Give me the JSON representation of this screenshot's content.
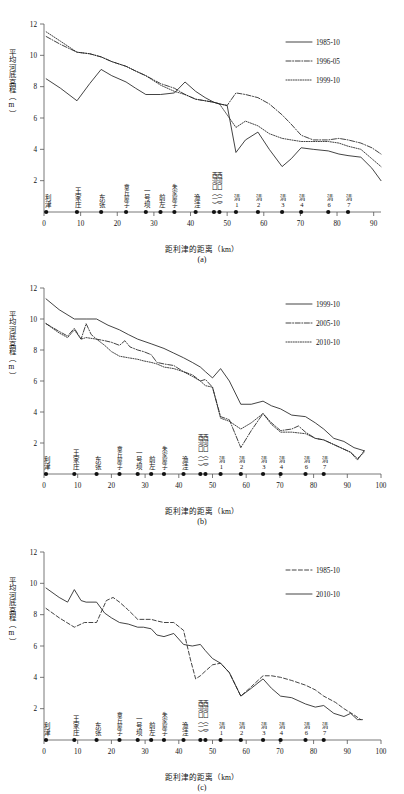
{
  "figure": {
    "axis": {
      "ylabel": "平均河底高程（m）",
      "xlabel": "距利津的距离（km）",
      "yticks": [
        "2",
        "4",
        "6",
        "8",
        "10",
        "12"
      ],
      "xticks_a": [
        "0",
        "10",
        "20",
        "30",
        "40",
        "50",
        "60",
        "70",
        "80",
        "90"
      ],
      "xticks_bc": [
        "0",
        "10",
        "20",
        "30",
        "40",
        "50",
        "60",
        "70",
        "80",
        "90",
        "100"
      ]
    },
    "stations": [
      {
        "label": "利津",
        "km": 0.6
      },
      {
        "label": "王家庄",
        "km": 9.0
      },
      {
        "label": "东张",
        "km": 15.6
      },
      {
        "label": "章丘屋子",
        "km": 22.4
      },
      {
        "label": "一号坝",
        "km": 27.8
      },
      {
        "label": "前左",
        "km": 31.8
      },
      {
        "label": "朱家屋子",
        "km": 35.6
      },
      {
        "label": "渔洼",
        "km": 41.4
      },
      {
        "label": "西河口（一）",
        "km": 46.4
      },
      {
        "label": "西河口（二）",
        "km": 47.9
      },
      {
        "label": "清1",
        "km": 52.4
      },
      {
        "label": "清2",
        "km": 58.4
      },
      {
        "label": "清3",
        "km": 65.0
      },
      {
        "label": "清4",
        "km": 70.2
      },
      {
        "label": "清6",
        "km": 77.6
      },
      {
        "label": "清7",
        "km": 83.0
      }
    ],
    "captions": {
      "a": "(a)",
      "b": "(b)",
      "c": "(c)"
    }
  },
  "chart_data": [
    {
      "type": "line",
      "panel": "a",
      "title": "",
      "xlabel": "距利津的距离（km）",
      "ylabel": "平均河底高程（m）",
      "xlim": [
        0,
        92
      ],
      "ylim": [
        1.2,
        12
      ],
      "grid": false,
      "legend_position": "top-right",
      "series": [
        {
          "name": "1985-10",
          "style": "solid",
          "x": [
            0.6,
            4.5,
            9.0,
            12.5,
            15.6,
            18.5,
            22.4,
            25.0,
            27.8,
            31.8,
            35.6,
            38.5,
            41.4,
            44.0,
            46.4,
            47.9,
            50.0,
            52.4,
            55.0,
            58.4,
            61.5,
            65.0,
            67.5,
            70.2,
            73.5,
            77.6,
            80.5,
            83.0,
            86.5,
            89.5,
            92.0
          ],
          "y": [
            8.5,
            7.9,
            7.1,
            8.2,
            9.1,
            8.7,
            8.3,
            7.9,
            7.5,
            7.5,
            7.6,
            8.3,
            7.7,
            7.3,
            7.0,
            6.9,
            6.8,
            3.8,
            4.6,
            5.1,
            4.0,
            2.9,
            3.4,
            4.1,
            4.0,
            3.9,
            3.7,
            3.6,
            3.5,
            2.8,
            2.0
          ]
        },
        {
          "name": "1996-05",
          "style": "dashdot",
          "x": [
            0.6,
            4.5,
            9.0,
            12.5,
            15.6,
            18.5,
            22.4,
            25.0,
            27.8,
            31.8,
            35.6,
            38.5,
            41.4,
            44.0,
            46.4,
            47.9,
            50.0,
            52.4,
            55.0,
            58.4,
            61.5,
            65.0,
            67.5,
            70.2,
            73.5,
            77.6,
            80.5,
            83.0,
            86.5,
            89.5,
            92.0
          ],
          "y": [
            11.2,
            10.7,
            10.2,
            10.1,
            9.9,
            9.6,
            9.3,
            9.0,
            8.7,
            8.2,
            7.9,
            7.5,
            7.2,
            7.1,
            7.0,
            6.9,
            6.8,
            7.6,
            7.5,
            7.3,
            6.9,
            6.2,
            5.6,
            4.9,
            4.6,
            4.6,
            4.7,
            4.6,
            4.4,
            4.1,
            3.7
          ]
        },
        {
          "name": "1999-10",
          "style": "dotted",
          "x": [
            0.6,
            4.5,
            9.0,
            12.5,
            15.6,
            18.5,
            22.4,
            25.0,
            27.8,
            31.8,
            35.6,
            38.5,
            41.4,
            44.0,
            46.4,
            47.9,
            50.0,
            52.4,
            55.0,
            58.4,
            61.5,
            65.0,
            67.5,
            70.2,
            73.5,
            77.6,
            80.5,
            83.0,
            86.5,
            89.5,
            92.0
          ],
          "y": [
            11.5,
            10.9,
            10.2,
            10.1,
            9.9,
            9.6,
            9.3,
            9.0,
            8.7,
            8.1,
            7.7,
            7.5,
            7.2,
            7.1,
            7.0,
            6.9,
            6.2,
            5.4,
            5.8,
            5.5,
            5.0,
            4.7,
            4.6,
            4.5,
            4.5,
            4.5,
            4.4,
            4.2,
            4.0,
            3.4,
            2.9
          ]
        }
      ]
    },
    {
      "type": "line",
      "panel": "b",
      "title": "",
      "xlabel": "距利津的距离（km）",
      "ylabel": "平均河底高程（m）",
      "xlim": [
        0,
        100
      ],
      "ylim": [
        1.0,
        12
      ],
      "grid": false,
      "legend_position": "top-right",
      "series": [
        {
          "name": "1999-10",
          "style": "solid",
          "x": [
            0.6,
            4.5,
            9.0,
            12.5,
            15.6,
            19.0,
            22.4,
            25.0,
            27.8,
            31.8,
            35.6,
            38.5,
            41.4,
            44.0,
            46.4,
            47.9,
            50.0,
            52.4,
            55.0,
            58.4,
            61.5,
            65.0,
            67.5,
            70.2,
            73.5,
            77.6,
            80.5,
            83.0,
            86.0,
            89.0,
            92.0,
            95.0
          ],
          "y": [
            11.3,
            10.6,
            10.0,
            10.0,
            10.0,
            9.6,
            9.3,
            9.0,
            8.7,
            8.4,
            8.1,
            7.8,
            7.5,
            7.2,
            6.9,
            6.6,
            6.2,
            6.8,
            6.0,
            4.5,
            4.5,
            4.7,
            4.4,
            4.2,
            3.8,
            3.7,
            3.3,
            2.9,
            2.3,
            2.1,
            1.7,
            1.5
          ]
        },
        {
          "name": "2005-10",
          "style": "dashdot",
          "x": [
            0.6,
            4.5,
            7.0,
            9.0,
            11.0,
            12.5,
            14.0,
            15.6,
            18.0,
            20.0,
            22.4,
            24.0,
            25.5,
            27.8,
            29.5,
            31.8,
            33.5,
            35.6,
            38.5,
            41.4,
            44.0,
            46.4,
            47.9,
            50.0,
            52.4,
            55.0,
            58.4,
            61.5,
            65.0,
            67.5,
            70.2,
            73.5,
            75.5,
            77.6,
            80.5,
            83.0,
            86.0,
            89.0,
            91.0,
            93.0,
            95.0
          ],
          "y": [
            9.7,
            9.2,
            8.9,
            9.4,
            8.7,
            9.7,
            9.0,
            8.7,
            8.6,
            8.5,
            8.3,
            8.6,
            8.2,
            8.0,
            7.9,
            7.7,
            7.2,
            7.1,
            7.0,
            6.6,
            6.4,
            6.0,
            6.1,
            5.6,
            3.7,
            3.5,
            1.7,
            2.8,
            3.9,
            3.3,
            2.8,
            2.9,
            3.1,
            2.7,
            2.3,
            2.2,
            1.9,
            1.6,
            1.4,
            0.9,
            1.5
          ]
        },
        {
          "name": "2010-10",
          "style": "dotted",
          "x": [
            0.6,
            4.5,
            7.0,
            9.0,
            11.0,
            12.5,
            15.6,
            18.0,
            20.0,
            22.4,
            25.0,
            27.8,
            29.5,
            31.8,
            33.5,
            35.6,
            38.5,
            41.4,
            44.0,
            46.4,
            47.9,
            50.0,
            52.4,
            55.0,
            58.4,
            61.5,
            65.0,
            67.5,
            70.2,
            73.5,
            77.6,
            80.5,
            83.0,
            86.0,
            89.0,
            91.0,
            93.0,
            95.0
          ],
          "y": [
            9.7,
            9.1,
            8.8,
            9.3,
            8.7,
            8.8,
            8.7,
            8.3,
            7.9,
            7.6,
            7.5,
            7.4,
            7.3,
            7.2,
            7.1,
            6.9,
            6.8,
            6.6,
            6.3,
            6.0,
            5.7,
            5.6,
            3.6,
            3.4,
            2.9,
            3.3,
            3.9,
            3.2,
            2.7,
            2.7,
            2.6,
            2.3,
            2.2,
            1.9,
            1.6,
            1.4,
            1.0,
            1.4
          ]
        }
      ]
    },
    {
      "type": "line",
      "panel": "c",
      "title": "",
      "xlabel": "距利津的距离（km）",
      "ylabel": "平均河底高程（m）",
      "xlim": [
        0,
        100
      ],
      "ylim": [
        1.0,
        12
      ],
      "grid": false,
      "legend_position": "top-right",
      "series": [
        {
          "name": "1985-10",
          "style": "dashed",
          "x": [
            0.6,
            4.5,
            9.0,
            12.0,
            15.6,
            18.5,
            20.5,
            22.4,
            25.0,
            27.8,
            31.8,
            33.5,
            35.6,
            38.5,
            41.4,
            43.5,
            45.0,
            46.4,
            47.9,
            50.0,
            52.4,
            55.0,
            58.4,
            61.5,
            65.0,
            67.5,
            70.2,
            73.5,
            77.6,
            80.5,
            83.0,
            86.5,
            89.0,
            92.0,
            94.0
          ],
          "y": [
            8.4,
            7.8,
            7.2,
            7.5,
            7.5,
            8.9,
            9.1,
            8.8,
            8.3,
            7.7,
            7.7,
            7.6,
            7.5,
            7.5,
            7.0,
            5.1,
            3.9,
            4.1,
            4.4,
            4.8,
            4.9,
            4.3,
            2.8,
            3.4,
            4.1,
            4.1,
            4.0,
            3.8,
            3.5,
            3.2,
            2.8,
            2.4,
            2.0,
            1.6,
            1.3
          ]
        },
        {
          "name": "2010-10",
          "style": "solid",
          "x": [
            0.6,
            4.5,
            7.0,
            9.0,
            11.0,
            12.5,
            15.6,
            18.0,
            20.0,
            22.4,
            25.0,
            27.8,
            29.5,
            31.8,
            33.5,
            35.6,
            38.5,
            41.4,
            44.0,
            46.4,
            47.9,
            50.0,
            52.4,
            55.0,
            58.4,
            61.5,
            65.0,
            67.5,
            70.2,
            73.5,
            77.6,
            80.5,
            83.0,
            86.0,
            89.0,
            91.0,
            93.0,
            94.5
          ],
          "y": [
            9.7,
            9.1,
            8.8,
            9.6,
            8.9,
            8.8,
            8.8,
            8.1,
            7.8,
            7.5,
            7.4,
            7.2,
            7.2,
            7.1,
            6.7,
            6.6,
            6.8,
            6.1,
            6.0,
            6.1,
            5.7,
            5.2,
            4.9,
            4.3,
            2.8,
            3.3,
            3.9,
            3.3,
            2.8,
            2.7,
            2.3,
            2.1,
            2.2,
            1.7,
            1.5,
            1.7,
            1.3,
            1.3
          ]
        }
      ]
    }
  ]
}
